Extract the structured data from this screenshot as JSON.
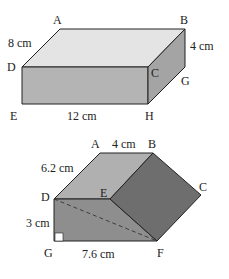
{
  "figure1": {
    "type": "cuboid",
    "vertices": [
      "A",
      "B",
      "C",
      "D",
      "E",
      "G",
      "H"
    ],
    "labels": {
      "A": "A",
      "B": "B",
      "C": "C",
      "D": "D",
      "E": "E",
      "G": "G",
      "H": "H"
    },
    "dimensions": {
      "AD": "8 cm",
      "BG": "4 cm",
      "EH": "12 cm"
    },
    "colors": {
      "top_face": "#e4e4e4",
      "front_face": "#b4b4b4",
      "side_face": "#a4a4a4",
      "edge": "#222222"
    }
  },
  "figure2": {
    "type": "triangular-prism",
    "vertices": [
      "A",
      "B",
      "C",
      "D",
      "E",
      "F",
      "G"
    ],
    "labels": {
      "A": "A",
      "B": "B",
      "C": "C",
      "D": "D",
      "E": "E",
      "F": "F",
      "G": "G"
    },
    "dimensions": {
      "AB": "4 cm",
      "AD": "6.2 cm",
      "DG": "3 cm",
      "GF": "7.6 cm"
    },
    "right_angle_at": "G",
    "dashed_edge": "DF",
    "colors": {
      "top_face": "#b0b0b0",
      "front_face": "#8e8e8e",
      "slanted_face": "#6e6e6e",
      "edge": "#222222"
    }
  }
}
